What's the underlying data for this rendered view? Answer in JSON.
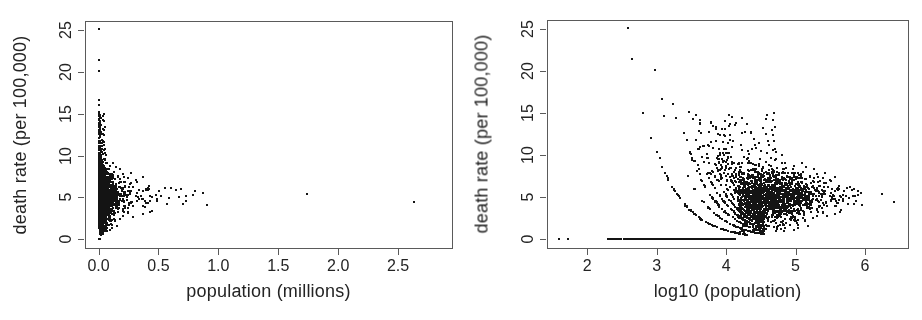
{
  "figure": {
    "width": 922,
    "height": 320,
    "background": "#ffffff",
    "point_color": "#141414",
    "frame_color": "#5a5a5a",
    "text_color": "#242424"
  },
  "chart_data": {
    "type": "scatter",
    "title": "",
    "panels": [
      {
        "id": "raw-population-panel",
        "xlabel": "population (millions)",
        "ylabel": "death rate (per 100,000)",
        "xlim": [
          -0.113,
          2.95
        ],
        "ylim": [
          -1.05,
          26.1
        ],
        "xticks": [
          0,
          0.5,
          1,
          1.5,
          2,
          2.5
        ],
        "xtick_labels": [
          "0.0",
          "0.5",
          "1.0",
          "1.5",
          "2.0",
          "2.5"
        ],
        "yticks": [
          0,
          5,
          10,
          15,
          20,
          25
        ],
        "ytick_labels": [
          "0",
          "5",
          "10",
          "15",
          "20",
          "25"
        ],
        "x_transform": "pop_millions",
        "box": {
          "left": 85,
          "top": 21,
          "right": 452,
          "bottom": 248
        }
      },
      {
        "id": "log10-population-panel",
        "xlabel": "log10 (population)",
        "ylabel": "death rate (per 100,000)",
        "xlim": [
          1.42,
          6.62
        ],
        "ylim": [
          -1.05,
          26.1
        ],
        "xticks": [
          2,
          3,
          4,
          5,
          6
        ],
        "xtick_labels": [
          "2",
          "3",
          "4",
          "5",
          "6"
        ],
        "yticks": [
          0,
          5,
          10,
          15,
          20,
          25
        ],
        "ytick_labels": [
          "0",
          "5",
          "10",
          "15",
          "20",
          "25"
        ],
        "x_transform": "log10_pop",
        "box": {
          "left": 547,
          "top": 20,
          "right": 908,
          "bottom": 248
        }
      }
    ],
    "dataset": {
      "note": "points are [log10_population, death_rate_per_100000]",
      "seed": 1337,
      "explicit_points": [
        [
          1.59,
          0.05
        ],
        [
          1.72,
          0.05
        ],
        [
          2.58,
          25.1
        ],
        [
          2.65,
          21.4
        ],
        [
          2.97,
          20.1
        ],
        [
          3.07,
          16.7
        ],
        [
          3.24,
          16.1
        ],
        [
          2.8,
          15.0
        ],
        [
          3.1,
          14.7
        ],
        [
          3.28,
          14.4
        ],
        [
          3.47,
          15.2
        ],
        [
          3.52,
          14.3
        ],
        [
          3.56,
          14.8
        ],
        [
          3.62,
          13.8
        ],
        [
          3.78,
          13.9
        ],
        [
          3.81,
          13.5
        ],
        [
          3.94,
          13.1
        ],
        [
          2.92,
          12.1
        ],
        [
          3.4,
          12.6
        ],
        [
          4.05,
          12.4
        ],
        [
          4.1,
          11.7
        ],
        [
          4.22,
          11.2
        ],
        [
          6.24,
          5.4
        ],
        [
          6.42,
          4.4
        ]
      ],
      "zero_line_segments": [
        {
          "n": 245,
          "x0": 2.52,
          "x1": 4.05
        },
        {
          "n": 14,
          "x0": 2.28,
          "x1": 2.54
        },
        {
          "n": 6,
          "x0": 4.05,
          "x1": 4.17
        }
      ],
      "bands": {
        "k_min": 1,
        "k_max": 11,
        "base": 4.02,
        "rate_min": 0.5,
        "x_end_max": 4.55,
        "caps": [
          12.3,
          11.0,
          14.2,
          10.8,
          13.5,
          11.6,
          14.8,
          12.1,
          10.6,
          13.2,
          11.3
        ],
        "n_base": 95,
        "n_step": 4,
        "x_bias": 0.62,
        "skip_prob": 0.1,
        "rate_jitter": 0.05,
        "x_jitter": 0.012
      },
      "cloud": {
        "n": 1500,
        "x_mean": 4.62,
        "x_sd": 0.38,
        "x_min": 4.17,
        "x_max": 6.0,
        "y_mean_base": 5.25,
        "y_mean_slope": -0.15,
        "y_sd_base": 1.9,
        "y_sd_slope": -0.5,
        "y_sd_min": 0.75,
        "y_min": 0.5,
        "y_max": 12.5
      },
      "upper_scatter": {
        "n": 120,
        "x0": 3.55,
        "x1": 4.72,
        "y0": 7.8,
        "y_span": 7.2,
        "y_pow": 1.7,
        "left_thin_x": 3.95,
        "left_thin_prob": 0.5
      },
      "low_scatter": {
        "n": 34,
        "x0": 4.18,
        "x1": 5.15,
        "y0": 0.7,
        "y1": 3.0
      },
      "tail": {
        "n": 28,
        "x0": 5.55,
        "x1": 5.95,
        "y0": 4.2,
        "y1": 6.2
      }
    }
  }
}
